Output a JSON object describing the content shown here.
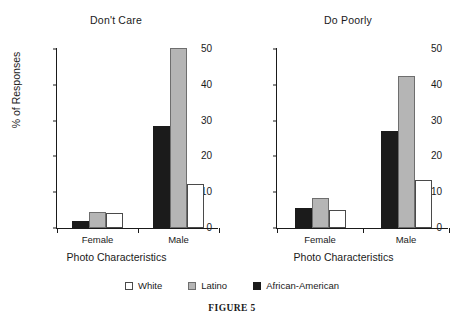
{
  "caption": "FIGURE 5",
  "legend": {
    "items": [
      {
        "label": "White",
        "swatch": "white",
        "color": "#ffffff"
      },
      {
        "label": "Latino",
        "swatch": "gray",
        "color": "#b5b5b5"
      },
      {
        "label": "African-American",
        "swatch": "black",
        "color": "#1b1b1b"
      }
    ]
  },
  "chart_data": [
    {
      "type": "bar",
      "title": "Don't Care",
      "xlabel": "Photo Characteristics",
      "ylabel": "% of Responses",
      "categories": [
        "Female",
        "Male"
      ],
      "ylim": [
        0,
        50
      ],
      "yticks": [
        0,
        10,
        20,
        30,
        40,
        50
      ],
      "ytick_labels": [
        "0",
        "10",
        "20",
        "30",
        "40",
        "50"
      ],
      "grid": false,
      "legend_position": "bottom",
      "series": [
        {
          "name": "African-American",
          "color": "#1b1b1b",
          "values": [
            2.0,
            28.5
          ]
        },
        {
          "name": "Latino",
          "color": "#b5b5b5",
          "values": [
            4.5,
            50.3
          ]
        },
        {
          "name": "White",
          "color": "#ffffff",
          "values": [
            4.3,
            12.3
          ]
        }
      ]
    },
    {
      "type": "bar",
      "title": "Do Poorly",
      "xlabel": "Photo Characteristics",
      "ylabel": "",
      "categories": [
        "Female",
        "Male"
      ],
      "ylim": [
        0,
        50
      ],
      "yticks": [
        0,
        10,
        20,
        30,
        40,
        50
      ],
      "ytick_labels": [
        "0",
        "10",
        "20",
        "30",
        "40",
        "50"
      ],
      "grid": false,
      "legend_position": "bottom",
      "series": [
        {
          "name": "African-American",
          "color": "#1b1b1b",
          "values": [
            5.5,
            27.0
          ]
        },
        {
          "name": "Latino",
          "color": "#b5b5b5",
          "values": [
            8.3,
            42.5
          ]
        },
        {
          "name": "White",
          "color": "#ffffff",
          "values": [
            5.0,
            13.5
          ]
        }
      ]
    }
  ]
}
